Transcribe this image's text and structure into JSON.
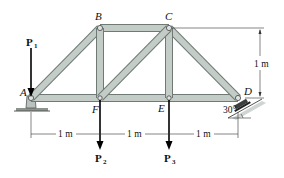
{
  "diagram": {
    "type": "truss",
    "joints": {
      "A": {
        "label": "A",
        "x": 31,
        "y": 98
      },
      "B": {
        "label": "B",
        "x": 100,
        "y": 28
      },
      "C": {
        "label": "C",
        "x": 169,
        "y": 28
      },
      "D": {
        "label": "D",
        "x": 238,
        "y": 98
      },
      "E": {
        "label": "E",
        "x": 169,
        "y": 98
      },
      "F": {
        "label": "F",
        "x": 100,
        "y": 98
      }
    },
    "members": [
      [
        "A",
        "B"
      ],
      [
        "B",
        "C"
      ],
      [
        "C",
        "D"
      ],
      [
        "A",
        "F"
      ],
      [
        "F",
        "E"
      ],
      [
        "E",
        "D"
      ],
      [
        "B",
        "F"
      ],
      [
        "C",
        "E"
      ],
      [
        "F",
        "C"
      ]
    ],
    "loads": [
      {
        "label": "P",
        "sub": "1",
        "joint": "A",
        "direction": "down"
      },
      {
        "label": "P",
        "sub": "2",
        "joint": "F",
        "direction": "down"
      },
      {
        "label": "P",
        "sub": "3",
        "joint": "E",
        "direction": "down"
      }
    ],
    "supports": [
      {
        "joint": "A",
        "type": "pin"
      },
      {
        "joint": "D",
        "type": "rocker",
        "incline_angle": "30°"
      }
    ],
    "dimensions": {
      "horizontal": [
        "1 m",
        "1 m",
        "1 m"
      ],
      "vertical": "1 m",
      "angle": "30°"
    },
    "colors": {
      "member_fill": "#c3ccc7",
      "member_edge": "#6f7a74",
      "support_fill": "#b9c2bd",
      "ink": "#111111"
    }
  }
}
